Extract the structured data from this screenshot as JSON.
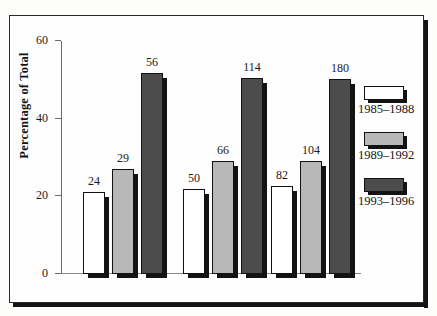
{
  "chart_data": {
    "type": "bar",
    "title": "",
    "subtitle": "",
    "xlabel": "",
    "ylabel": "Percentage of Total",
    "ylim": [
      0,
      60
    ],
    "yticks": [
      0,
      20,
      40,
      60
    ],
    "ytick_labels": [
      "0",
      "20",
      "40",
      "60"
    ],
    "grid": false,
    "legend_position": "right",
    "categories": [
      "Articles",
      "Participants",
      "Outcomes"
    ],
    "series": [
      {
        "name": "1985–1988",
        "color": "#ffffff",
        "values": [
          21.2,
          22.0,
          22.6
        ],
        "data_labels": [
          "24",
          "29",
          "56"
        ]
      },
      {
        "name": "1989–1992",
        "color": "#b8b8b8",
        "values": [
          27.0,
          29.2,
          28.8
        ],
        "data_labels": [
          "50",
          "66",
          "114"
        ]
      },
      {
        "name": "1993–1996",
        "color": "#4c4c4c",
        "values": [
          51.8,
          50.6,
          50.2
        ],
        "data_labels": [
          "82",
          "104",
          "180"
        ]
      }
    ],
    "groups": [
      {
        "category": "Articles",
        "bars": [
          {
            "series": "1985–1988",
            "label": "24",
            "percent": 21.2
          },
          {
            "series": "1989–1992",
            "label": "29",
            "percent": 27.0
          },
          {
            "series": "1993–1996",
            "label": "56",
            "percent": 51.8
          }
        ]
      },
      {
        "category": "Participants",
        "bars": [
          {
            "series": "1985–1988",
            "label": "50",
            "percent": 22.0
          },
          {
            "series": "1989–1992",
            "label": "66",
            "percent": 29.2
          },
          {
            "series": "1993–1996",
            "label": "114",
            "percent": 50.6
          }
        ]
      },
      {
        "category": "Outcomes",
        "bars": [
          {
            "series": "1985–1988",
            "label": "82",
            "percent": 22.6
          },
          {
            "series": "1989–1992",
            "label": "104",
            "percent": 29.2
          },
          {
            "series": "1993–1996",
            "label": "180",
            "percent": 50.2
          }
        ]
      }
    ]
  },
  "legend": {
    "items": [
      {
        "label": "1985–1988",
        "swatch": "white-swatch"
      },
      {
        "label": "1989–1992",
        "swatch": "light-gray-swatch"
      },
      {
        "label": "1993–1996",
        "swatch": "dark-gray-swatch"
      }
    ]
  },
  "axis": {
    "y_title": "Percentage of Total",
    "y_ticks": [
      "60",
      "40",
      "20",
      "0"
    ]
  },
  "colors": {
    "series_1985_1988": "#ffffff",
    "series_1989_1992": "#b8b8b8",
    "series_1993_1996": "#4c4c4c",
    "frame": "#2a2a2a",
    "text": "#161616"
  }
}
